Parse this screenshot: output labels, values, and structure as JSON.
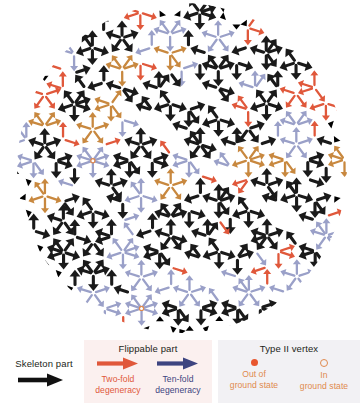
{
  "figure": {
    "shape": "decagonal disk"
  },
  "colors": {
    "skeleton": "#1a1a1a",
    "two_fold": "#e0583b",
    "ten_fold": "#3d4480",
    "tan": "#c8883f",
    "lavender": "#9aa0c8",
    "out_of_ground_state": "#e8562e",
    "in_ground_state": "#e08a4e",
    "flippable_panel_bg": "#fbf0ef",
    "type2_panel_bg": "#f2f1f4",
    "page_bg": "#ffffff"
  },
  "legend": {
    "skeleton": {
      "label": "Skeleton part",
      "arrow_icon": "right-arrow-icon"
    },
    "flippable": {
      "title": "Flippable part",
      "items": [
        {
          "arrow_icon": "right-arrow-icon",
          "caption": "Two-fold\ndegeneracy",
          "line1": "Two-fold",
          "line2": "degeneracy"
        },
        {
          "arrow_icon": "right-arrow-icon",
          "caption": "Ten-fold\ndegeneracy",
          "line1": "Ten-fold",
          "line2": "degeneracy"
        }
      ]
    },
    "type2": {
      "title": "Type II vertex",
      "items": [
        {
          "marker_icon": "filled-circle-icon",
          "line1": "Out of",
          "line2": "ground state"
        },
        {
          "marker_icon": "hollow-circle-icon",
          "line1": "In",
          "line2": "ground state"
        }
      ]
    }
  },
  "tiling": {
    "center_x": 182,
    "center_y": 170,
    "radius": 163,
    "symmetry": 10,
    "edge_length": 19.3
  }
}
